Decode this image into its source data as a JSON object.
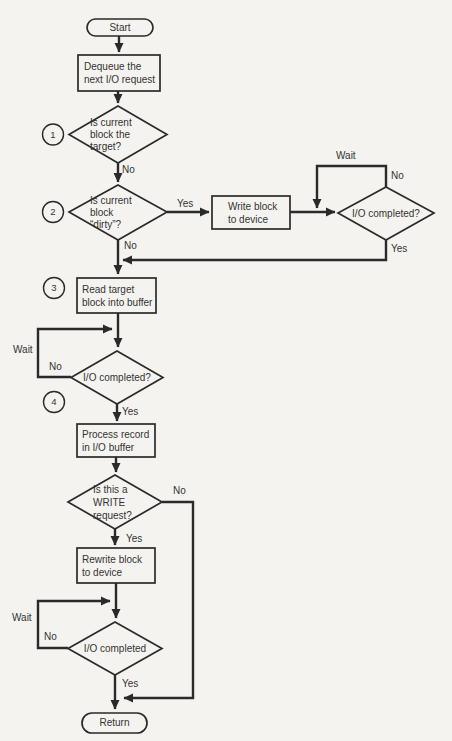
{
  "page": {
    "background": "#f5f3ef",
    "ink": "#2a2a2a",
    "text": "#333333"
  },
  "flowchart": {
    "nodes": {
      "start": {
        "type": "terminal",
        "label": "Start"
      },
      "dequeue": {
        "type": "process",
        "label": "Dequeue the\nnext I/O request"
      },
      "is_target": {
        "type": "decision",
        "label": "Is current\nblock the\ntarget?"
      },
      "is_dirty": {
        "type": "decision",
        "label": "Is current\nblock\n“dirty”?"
      },
      "write_block": {
        "type": "process",
        "label": "Write block\nto device"
      },
      "io_completed_1": {
        "type": "decision",
        "label": "I/O completed?"
      },
      "read_target": {
        "type": "process",
        "label": "Read target\nblock into buffer"
      },
      "io_completed_2": {
        "type": "decision",
        "label": "I/O completed?"
      },
      "process_record": {
        "type": "process",
        "label": "Process record\nin I/O buffer"
      },
      "is_write": {
        "type": "decision",
        "label": "Is this a\nWRITE\nrequest?"
      },
      "rewrite_block": {
        "type": "process",
        "label": "Rewrite block\nto device"
      },
      "io_completed_3": {
        "type": "decision",
        "label": "I/O completed"
      },
      "return": {
        "type": "terminal",
        "label": "Return"
      }
    },
    "edge_labels": {
      "no_target": "No",
      "yes_dirty": "Yes",
      "no_dirty": "No",
      "wait_1": "Wait",
      "no_io1": "No",
      "yes_io1": "Yes",
      "wait_2": "Wait",
      "no_io2": "No",
      "yes_io2": "Yes",
      "no_write": "No",
      "yes_write": "Yes",
      "wait_3": "Wait",
      "no_io3": "No",
      "yes_io3": "Yes"
    },
    "step_markers": {
      "m1": "1",
      "m2": "2",
      "m3": "3",
      "m4": "4"
    }
  }
}
